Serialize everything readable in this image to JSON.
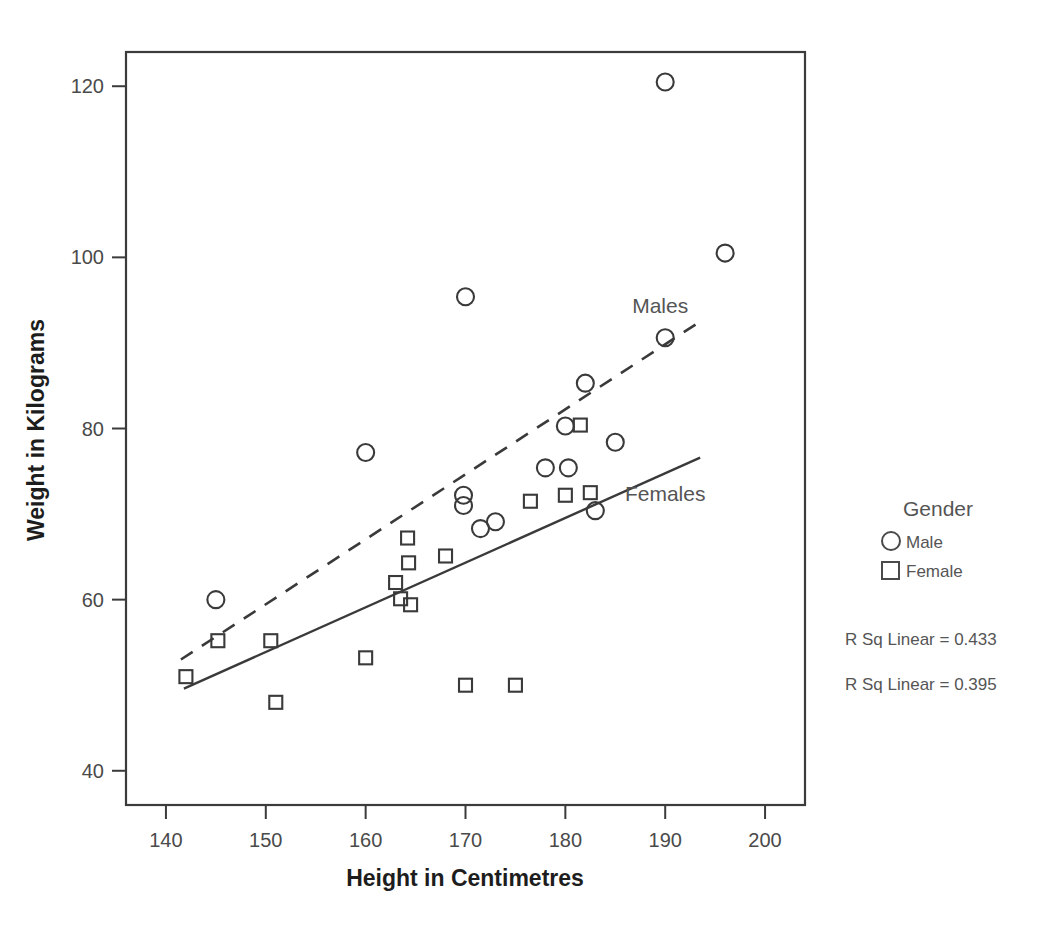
{
  "chart_data": {
    "type": "scatter",
    "title": "",
    "xlabel": "Height in Centimetres",
    "ylabel": "Weight in Kilograms",
    "xlim": [
      136,
      204
    ],
    "ylim": [
      36,
      124
    ],
    "xticks": [
      140,
      150,
      160,
      170,
      180,
      190,
      200
    ],
    "yticks": [
      40,
      60,
      80,
      100,
      120
    ],
    "grid": false,
    "legend_position": "right",
    "legend": {
      "title": "Gender",
      "entries": [
        {
          "label": "Male",
          "marker": "circle"
        },
        {
          "label": "Female",
          "marker": "square"
        }
      ]
    },
    "annotations": [
      {
        "text": "Males",
        "x": 189.5,
        "y": 93.5
      },
      {
        "text": "Females",
        "x": 190.0,
        "y": 71.5
      }
    ],
    "statistics": [
      {
        "label": "R Sq Linear = 0.433",
        "series": "Male"
      },
      {
        "label": "R Sq Linear = 0.395",
        "series": "Female"
      }
    ],
    "series": [
      {
        "name": "Male",
        "marker": "circle",
        "points": [
          [
            145.0,
            60.0
          ],
          [
            160.0,
            77.2
          ],
          [
            170.0,
            95.4
          ],
          [
            169.8,
            72.2
          ],
          [
            169.8,
            71.0
          ],
          [
            171.5,
            68.3
          ],
          [
            173.0,
            69.1
          ],
          [
            178.0,
            75.4
          ],
          [
            180.3,
            75.4
          ],
          [
            180.0,
            80.3
          ],
          [
            182.0,
            85.3
          ],
          [
            185.0,
            78.4
          ],
          [
            183.0,
            70.4
          ],
          [
            190.0,
            120.5
          ],
          [
            190.0,
            90.6
          ],
          [
            196.0,
            100.5
          ]
        ]
      },
      {
        "name": "Female",
        "marker": "square",
        "points": [
          [
            142.0,
            51.0
          ],
          [
            145.2,
            55.2
          ],
          [
            150.5,
            55.2
          ],
          [
            151.0,
            48.0
          ],
          [
            160.0,
            53.2
          ],
          [
            163.0,
            62.0
          ],
          [
            164.2,
            67.2
          ],
          [
            164.3,
            64.3
          ],
          [
            163.5,
            60.1
          ],
          [
            164.5,
            59.4
          ],
          [
            168.0,
            65.1
          ],
          [
            170.0,
            50.0
          ],
          [
            175.0,
            50.0
          ],
          [
            176.5,
            71.5
          ],
          [
            180.0,
            72.2
          ],
          [
            181.5,
            80.4
          ],
          [
            182.5,
            72.5
          ]
        ]
      }
    ],
    "fit_lines": [
      {
        "series": "Male",
        "style": "dashed",
        "x_start": 141.5,
        "y_start": 53.0,
        "x_end": 193.5,
        "y_end": 92.5
      },
      {
        "series": "Female",
        "style": "solid",
        "x_start": 141.8,
        "y_start": 49.6,
        "x_end": 193.5,
        "y_end": 76.6
      }
    ]
  }
}
